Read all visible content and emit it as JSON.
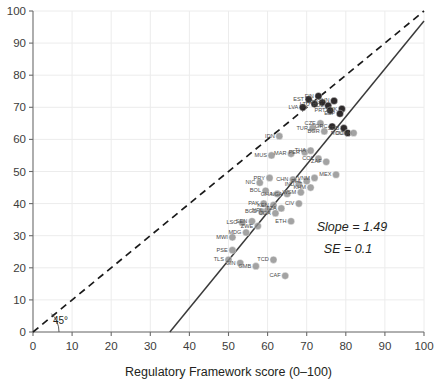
{
  "chart_data": {
    "type": "scatter",
    "title": "",
    "xlabel": "Regulatory Framework score (0–100)",
    "ylabel": "",
    "xlim": [
      0,
      100
    ],
    "ylim": [
      0,
      100
    ],
    "grid": true,
    "legend": "none",
    "xticks": [
      "0",
      "10",
      "20",
      "30",
      "40",
      "50",
      "60",
      "70",
      "80",
      "90",
      "100"
    ],
    "yticks": [
      "0",
      "10",
      "20",
      "30",
      "40",
      "50",
      "60",
      "70",
      "80",
      "90",
      "100"
    ],
    "xtick_values": [
      0,
      10,
      20,
      30,
      40,
      50,
      60,
      70,
      80,
      90,
      100
    ],
    "ytick_values": [
      0,
      10,
      20,
      30,
      40,
      50,
      60,
      70,
      80,
      90,
      100
    ],
    "annotations": {
      "slope": "Slope = 1.49",
      "se": "SE = 0.1",
      "angle": "45°"
    },
    "reference_line": {
      "name": "45-degree line",
      "style": "dashed",
      "color": "#1a1a1a",
      "x0": 0,
      "y0": 0,
      "x1": 100,
      "y1": 100
    },
    "fit_line": {
      "name": "regression line",
      "style": "solid",
      "color": "#3a3a3a",
      "slope": 1.49,
      "se": 0.1,
      "x0": 35.0,
      "y0": 0.0,
      "x1": 100.0,
      "y1": 96.9
    },
    "marker_colors": {
      "dark": "#231f20",
      "mid": "#8c8c8c",
      "light": "#b5b5b5"
    },
    "points": [
      {
        "label": "EST",
        "x": 70.5,
        "y": 72.5,
        "tone": "dark"
      },
      {
        "label": "FIN",
        "x": 73.0,
        "y": 73.5,
        "tone": "dark"
      },
      {
        "label": "LTU",
        "x": 72.0,
        "y": 71.0,
        "tone": "dark"
      },
      {
        "label": "LVA",
        "x": 69.0,
        "y": 70.0,
        "tone": "dark"
      },
      {
        "label": "HRV",
        "x": 74.0,
        "y": 71.5,
        "tone": "dark"
      },
      {
        "label": "POL",
        "x": 75.5,
        "y": 70.5,
        "tone": "dark"
      },
      {
        "label": "PRT",
        "x": 76.0,
        "y": 69.0,
        "tone": "dark"
      },
      {
        "label": "SVK",
        "x": 79.0,
        "y": 69.5,
        "tone": "dark"
      },
      {
        "label": "SVN",
        "x": 77.0,
        "y": 72.0,
        "tone": "dark"
      },
      {
        "label": "ESP",
        "x": 78.5,
        "y": 68.0,
        "tone": "dark"
      },
      {
        "label": "CZE",
        "x": 73.5,
        "y": 65.0,
        "tone": "mid"
      },
      {
        "label": "GRC",
        "x": 76.5,
        "y": 64.0,
        "tone": "dark"
      },
      {
        "label": "SRB",
        "x": 79.5,
        "y": 63.5,
        "tone": "dark"
      },
      {
        "label": "ROU",
        "x": 80.5,
        "y": 62.0,
        "tone": "dark"
      },
      {
        "label": "DOM",
        "x": 82.0,
        "y": 62.0,
        "tone": "mid"
      },
      {
        "label": "BGR",
        "x": 74.5,
        "y": 62.5,
        "tone": "mid"
      },
      {
        "label": "TUR",
        "x": 71.5,
        "y": 63.5,
        "tone": "mid"
      },
      {
        "label": "IDN",
        "x": 63.0,
        "y": 61.0,
        "tone": "mid"
      },
      {
        "label": "MUS",
        "x": 61.0,
        "y": 55.0,
        "tone": "mid"
      },
      {
        "label": "MAR",
        "x": 66.0,
        "y": 55.5,
        "tone": "mid"
      },
      {
        "label": "PER",
        "x": 69.5,
        "y": 56.0,
        "tone": "mid"
      },
      {
        "label": "THA",
        "x": 71.0,
        "y": 56.5,
        "tone": "mid"
      },
      {
        "label": "COL",
        "x": 73.0,
        "y": 54.0,
        "tone": "mid"
      },
      {
        "label": "ZAF",
        "x": 75.0,
        "y": 53.0,
        "tone": "mid"
      },
      {
        "label": "MEX",
        "x": 77.5,
        "y": 49.0,
        "tone": "mid"
      },
      {
        "label": "PRY",
        "x": 60.5,
        "y": 48.0,
        "tone": "mid"
      },
      {
        "label": "NIC",
        "x": 58.0,
        "y": 46.5,
        "tone": "mid"
      },
      {
        "label": "BOL",
        "x": 59.5,
        "y": 44.0,
        "tone": "mid"
      },
      {
        "label": "GHA",
        "x": 62.5,
        "y": 43.0,
        "tone": "mid"
      },
      {
        "label": "CHN",
        "x": 66.5,
        "y": 47.5,
        "tone": "mid"
      },
      {
        "label": "IND",
        "x": 68.0,
        "y": 46.0,
        "tone": "mid"
      },
      {
        "label": "PHL",
        "x": 70.0,
        "y": 47.0,
        "tone": "mid"
      },
      {
        "label": "VNM",
        "x": 72.0,
        "y": 48.0,
        "tone": "mid"
      },
      {
        "label": "KHM",
        "x": 71.0,
        "y": 45.0,
        "tone": "mid"
      },
      {
        "label": "WSM",
        "x": 68.5,
        "y": 43.5,
        "tone": "mid"
      },
      {
        "label": "NGA",
        "x": 65.0,
        "y": 43.0,
        "tone": "mid"
      },
      {
        "label": "PAK",
        "x": 59.0,
        "y": 40.0,
        "tone": "mid"
      },
      {
        "label": "KEN",
        "x": 61.5,
        "y": 39.5,
        "tone": "mid"
      },
      {
        "label": "BGD",
        "x": 58.5,
        "y": 37.5,
        "tone": "mid"
      },
      {
        "label": "NPL",
        "x": 60.0,
        "y": 38.0,
        "tone": "mid"
      },
      {
        "label": "UGA",
        "x": 62.0,
        "y": 37.0,
        "tone": "mid"
      },
      {
        "label": "TZA",
        "x": 63.5,
        "y": 38.5,
        "tone": "mid"
      },
      {
        "label": "CIV",
        "x": 68.0,
        "y": 40.0,
        "tone": "mid"
      },
      {
        "label": "ETH",
        "x": 66.0,
        "y": 34.5,
        "tone": "mid"
      },
      {
        "label": "LSO",
        "x": 53.5,
        "y": 34.0,
        "tone": "mid"
      },
      {
        "label": "SEN",
        "x": 56.0,
        "y": 34.5,
        "tone": "mid"
      },
      {
        "label": "MDG",
        "x": 54.5,
        "y": 31.0,
        "tone": "mid"
      },
      {
        "label": "MWI",
        "x": 51.0,
        "y": 29.5,
        "tone": "mid"
      },
      {
        "label": "ZWE",
        "x": 57.5,
        "y": 33.0,
        "tone": "mid"
      },
      {
        "label": "PSE",
        "x": 51.0,
        "y": 25.5,
        "tone": "mid"
      },
      {
        "label": "TLS",
        "x": 50.0,
        "y": 22.5,
        "tone": "mid"
      },
      {
        "label": "GIN",
        "x": 53.0,
        "y": 21.5,
        "tone": "mid"
      },
      {
        "label": "GMB",
        "x": 57.0,
        "y": 20.5,
        "tone": "mid"
      },
      {
        "label": "TCD",
        "x": 61.5,
        "y": 22.5,
        "tone": "mid"
      },
      {
        "label": "CAF",
        "x": 64.5,
        "y": 17.5,
        "tone": "mid"
      }
    ]
  }
}
